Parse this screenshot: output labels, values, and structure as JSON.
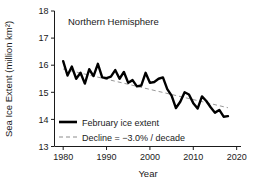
{
  "chart_data": {
    "type": "line",
    "title": "Northern Hemisphere",
    "xlabel": "Year",
    "ylabel": "Sea Ice Extent (million km²)",
    "xlim": [
      1978,
      2021
    ],
    "ylim": [
      13,
      18
    ],
    "xticks": [
      "1980",
      "1990",
      "2000",
      "2010",
      "2020"
    ],
    "xtick_values": [
      1980,
      1990,
      2000,
      2010,
      2020
    ],
    "yticks": [
      "13",
      "14",
      "15",
      "16",
      "17",
      "18"
    ],
    "ytick_values": [
      13,
      14,
      15,
      16,
      17,
      18
    ],
    "grid": false,
    "legend_position": "lower-left",
    "series": [
      {
        "name": "February ice extent",
        "style": "solid",
        "color": "#000000",
        "width": 2.4,
        "x": [
          1980,
          1981,
          1982,
          1983,
          1984,
          1985,
          1986,
          1987,
          1988,
          1989,
          1990,
          1991,
          1992,
          1993,
          1994,
          1995,
          1996,
          1997,
          1998,
          1999,
          2000,
          2001,
          2002,
          2003,
          2004,
          2005,
          2006,
          2007,
          2008,
          2009,
          2010,
          2011,
          2012,
          2013,
          2014,
          2015,
          2016,
          2017,
          2018
        ],
        "values": [
          16.15,
          15.62,
          15.95,
          15.5,
          15.72,
          15.32,
          15.85,
          15.6,
          16.05,
          15.55,
          15.52,
          15.58,
          15.82,
          15.5,
          15.75,
          15.35,
          15.45,
          15.22,
          15.25,
          15.72,
          15.35,
          15.38,
          15.5,
          15.55,
          15.12,
          14.88,
          14.42,
          14.65,
          15.0,
          14.92,
          14.6,
          14.4,
          14.85,
          14.68,
          14.45,
          14.25,
          14.35,
          14.1,
          14.12
        ]
      },
      {
        "name": "Decline = −3.0% / decade",
        "style": "dashed",
        "color": "#8c8c8c",
        "width": 0.9,
        "x": [
          1980,
          2018
        ],
        "values": [
          15.86,
          14.43
        ]
      }
    ],
    "annotations": []
  },
  "legend": {
    "items": [
      {
        "label": "February ice extent",
        "swatch": "solid-line-swatch"
      },
      {
        "label": "Decline = −3.0% / decade",
        "swatch": "dashed-line-swatch"
      }
    ]
  },
  "colors": {
    "series_line": "#000000",
    "trend_line": "#8c8c8c",
    "axis": "#1a1a1a",
    "text": "#1a1a1a",
    "background": "#ffffff"
  }
}
